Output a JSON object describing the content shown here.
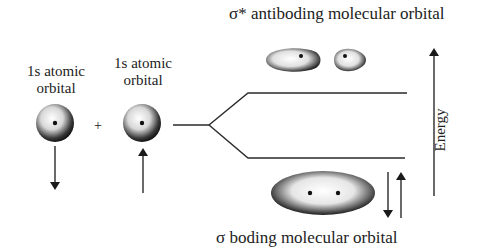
{
  "diagram": {
    "title_top": "σ* antiboding molecular orbital",
    "title_bottom": "σ boding molecular orbital",
    "atom_left": {
      "line1": "1s atomic",
      "line2": "orbital",
      "spin": "down"
    },
    "atom_right": {
      "line1": "1s atomic",
      "line2": "orbital",
      "spin": "up"
    },
    "plus_sign": "+",
    "axis_label": "Energy",
    "bonding_spins": [
      "down",
      "up"
    ],
    "colors": {
      "ink": "#1a1a1a",
      "background": "#ffffff"
    }
  }
}
